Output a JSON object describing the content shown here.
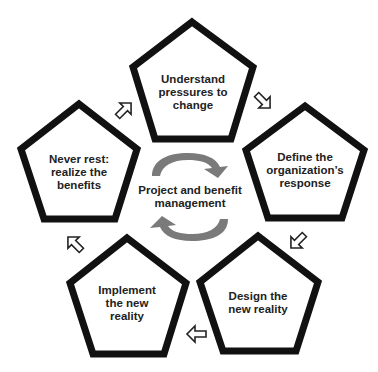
{
  "diagram": {
    "type": "cycle",
    "center": {
      "label": "Project and benefit\nmanagement",
      "icon": "refresh-cycle-icon",
      "color": "#7a7a7a"
    },
    "steps": [
      {
        "id": 1,
        "label": "Understand\npressures to\nchange"
      },
      {
        "id": 2,
        "label": "Define the\norganization’s\nresponse"
      },
      {
        "id": 3,
        "label": "Design the\nnew reality"
      },
      {
        "id": 4,
        "label": "Implement\nthe new\nreality"
      },
      {
        "id": 5,
        "label": "Never rest:\nrealize the\nbenefits"
      }
    ],
    "connectors": [
      {
        "from": 1,
        "to": 2,
        "icon": "arrow-down-right-icon"
      },
      {
        "from": 2,
        "to": 3,
        "icon": "arrow-down-left-icon"
      },
      {
        "from": 3,
        "to": 4,
        "icon": "arrow-left-icon"
      },
      {
        "from": 4,
        "to": 5,
        "icon": "arrow-up-left-icon"
      },
      {
        "from": 5,
        "to": 1,
        "icon": "arrow-up-right-icon"
      }
    ],
    "colors": {
      "outline": "#111111",
      "text": "#222222",
      "background": "#ffffff"
    }
  }
}
